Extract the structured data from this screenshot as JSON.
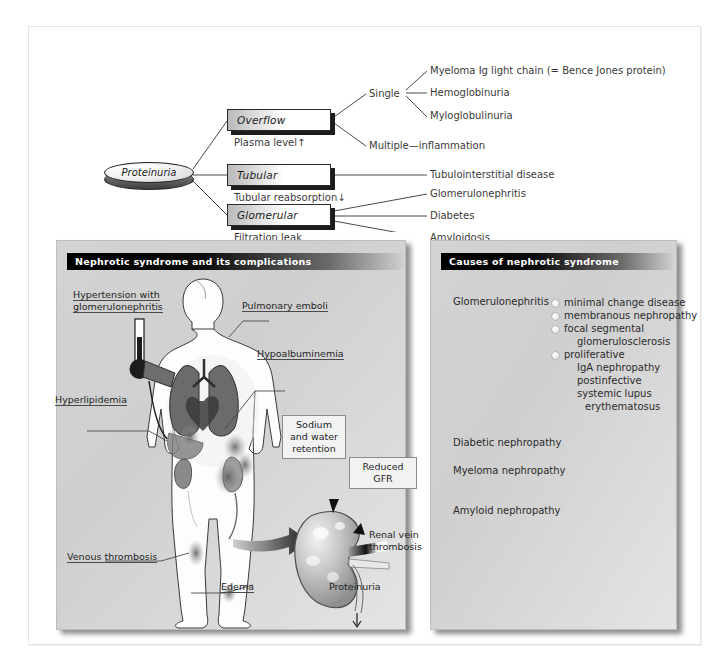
{
  "flowchart": {
    "root": {
      "label": "Proteinuria"
    },
    "nodes": [
      {
        "label": "Overflow",
        "sub_label": "Plasma level↑"
      },
      {
        "label": "Tubular",
        "sub_label": "Tubular reabsorption↓"
      },
      {
        "label": "Glomerular",
        "sub_label": "Filtration leak"
      }
    ],
    "overflow_branches": [
      {
        "label": "Single"
      },
      {
        "label": "Multiple—inflammation"
      }
    ],
    "single_leaves": [
      "Myeloma Ig light chain (= Bence Jones protein)",
      "Hemoglobinuria",
      "Myloglobulinuria"
    ],
    "tubular_leaves": [
      "Tubulointerstitial disease"
    ],
    "glomerular_leaves": [
      "Glomerulonephritis",
      "Diabetes",
      "Amyloidosis"
    ]
  },
  "left_panel": {
    "title": "Nephrotic syndrome and its complications",
    "annotations": [
      {
        "text": "Hypertension with"
      },
      {
        "text": "glomerulonephritis"
      },
      {
        "text": "Pulmonary emboli"
      },
      {
        "text": "Hypoalbuminemia"
      },
      {
        "text": "Hyperlipidemia"
      },
      {
        "text": "Venous thrombosis"
      },
      {
        "text": "Edema"
      },
      {
        "text": "Renal vein"
      },
      {
        "text": "thrombosis"
      },
      {
        "text": "Proteinuria"
      }
    ],
    "callouts": [
      {
        "line1": "Sodium",
        "line2": "and water",
        "line3": "retention"
      },
      {
        "line1": "Reduced GFR"
      }
    ]
  },
  "right_panel": {
    "title": "Causes of nephrotic syndrome",
    "groups": [
      {
        "name": "Glomerulonephritis"
      },
      {
        "name": "Diabetic nephropathy"
      },
      {
        "name": "Myeloma nephropathy"
      },
      {
        "name": "Amyloid nephropathy"
      }
    ],
    "gn_items": [
      {
        "text": "minimal change disease",
        "bullet": true,
        "indent": 0
      },
      {
        "text": "membranous nephropathy",
        "bullet": true,
        "indent": 0
      },
      {
        "text": "focal segmental",
        "bullet": true,
        "indent": 0
      },
      {
        "text": "glomerulosclerosis",
        "bullet": false,
        "indent": 1
      },
      {
        "text": "proliferative",
        "bullet": true,
        "indent": 0
      },
      {
        "text": "IgA nephropathy",
        "bullet": false,
        "indent": 1
      },
      {
        "text": "postinfective",
        "bullet": false,
        "indent": 1
      },
      {
        "text": "systemic lupus",
        "bullet": false,
        "indent": 1
      },
      {
        "text": "erythematosus",
        "bullet": false,
        "indent": 2
      }
    ]
  },
  "colors": {
    "page_background": "#ffffff",
    "panel_background": "#d0d0d0",
    "header_bar_dark": "#000000",
    "header_text": "#ffffff",
    "line": "#4a4a4a",
    "box_shadow": "#1c1c1c"
  }
}
